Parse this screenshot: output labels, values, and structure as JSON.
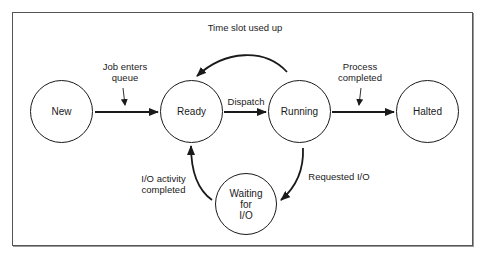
{
  "diagram": {
    "states": [
      {
        "id": "new",
        "label": "New"
      },
      {
        "id": "ready",
        "label": "Ready"
      },
      {
        "id": "running",
        "label": "Running"
      },
      {
        "id": "halted",
        "label": "Halted"
      },
      {
        "id": "waiting",
        "label_lines": [
          "Waiting",
          "for",
          "I/O"
        ]
      }
    ],
    "transitions": [
      {
        "from": "new",
        "to": "ready",
        "label_lines": [
          "Job enters",
          "queue"
        ]
      },
      {
        "from": "ready",
        "to": "running",
        "label": "Dispatch"
      },
      {
        "from": "running",
        "to": "ready",
        "label": "Time slot used up"
      },
      {
        "from": "running",
        "to": "halted",
        "label_lines": [
          "Process",
          "completed"
        ]
      },
      {
        "from": "running",
        "to": "waiting",
        "label": "Requested I/O"
      },
      {
        "from": "waiting",
        "to": "ready",
        "label_lines": [
          "I/O activity",
          "completed"
        ]
      }
    ],
    "colors": {
      "stroke": "#1a1a1a",
      "frame": "#555555",
      "background": "#ffffff"
    }
  }
}
